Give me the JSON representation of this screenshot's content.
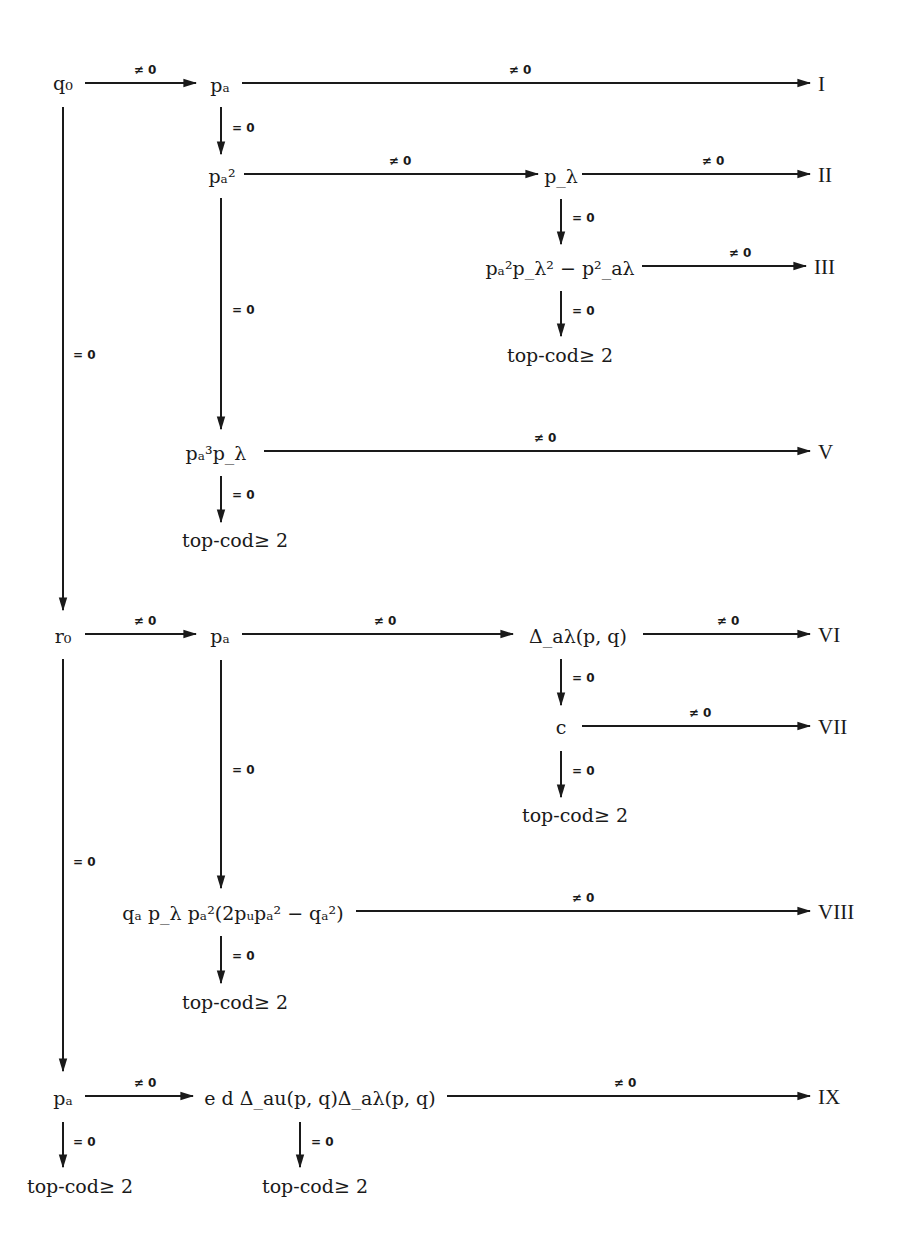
{
  "labels": {
    "nonzero": "≠ 0",
    "zero": "= 0",
    "top_cod": "top-cod≥ 2"
  },
  "nodes": {
    "q0": "q₀",
    "pa_1": "pₐ",
    "pa2": "pₐ²",
    "plambda": "p_λ",
    "pa2plambda2_minus": "pₐ²p_λ² − p²_aλ",
    "top_cod_1": "top-cod≥ 2",
    "pa3plambda": "pₐ³p_λ",
    "top_cod_2": "top-cod≥ 2",
    "r0": "r₀",
    "pa_2": "pₐ",
    "delta_alambda": "Δ_aλ(p, q)",
    "c": "c",
    "top_cod_3": "top-cod≥ 2",
    "qa_product": "qₐ p_λ pₐ²(2pᵤpₐ² − qₐ²)",
    "top_cod_4": "top-cod≥ 2",
    "pa_3": "pₐ",
    "ed_delta": "e d Δ_au(p, q)Δ_aλ(p, q)",
    "top_cod_5": "top-cod≥ 2",
    "top_cod_6": "top-cod≥ 2"
  },
  "outcomes": {
    "I": "I",
    "II": "II",
    "III": "III",
    "V": "V",
    "VI": "VI",
    "VII": "VII",
    "VIII": "VIII",
    "IX": "IX"
  },
  "edges": [
    {
      "from": "q0",
      "to": "pa_1",
      "label": "≠ 0"
    },
    {
      "from": "pa_1",
      "to": "I",
      "label": "≠ 0"
    },
    {
      "from": "pa_1",
      "to": "pa2",
      "label": "= 0"
    },
    {
      "from": "pa2",
      "to": "plambda",
      "label": "≠ 0"
    },
    {
      "from": "plambda",
      "to": "II",
      "label": "≠ 0"
    },
    {
      "from": "plambda",
      "to": "pa2plambda2_minus",
      "label": "= 0"
    },
    {
      "from": "pa2plambda2_minus",
      "to": "III",
      "label": "≠ 0"
    },
    {
      "from": "pa2plambda2_minus",
      "to": "top_cod_1",
      "label": "= 0"
    },
    {
      "from": "pa2",
      "to": "pa3plambda",
      "label": "= 0"
    },
    {
      "from": "pa3plambda",
      "to": "V",
      "label": "≠ 0"
    },
    {
      "from": "pa3plambda",
      "to": "top_cod_2",
      "label": "= 0"
    },
    {
      "from": "q0",
      "to": "r0",
      "label": "= 0"
    },
    {
      "from": "r0",
      "to": "pa_2",
      "label": "≠ 0"
    },
    {
      "from": "pa_2",
      "to": "delta_alambda",
      "label": "≠ 0"
    },
    {
      "from": "delta_alambda",
      "to": "VI",
      "label": "≠ 0"
    },
    {
      "from": "delta_alambda",
      "to": "c",
      "label": "= 0"
    },
    {
      "from": "c",
      "to": "VII",
      "label": "≠ 0"
    },
    {
      "from": "c",
      "to": "top_cod_3",
      "label": "= 0"
    },
    {
      "from": "pa_2",
      "to": "qa_product",
      "label": "= 0"
    },
    {
      "from": "qa_product",
      "to": "VIII",
      "label": "≠ 0"
    },
    {
      "from": "qa_product",
      "to": "top_cod_4",
      "label": "= 0"
    },
    {
      "from": "r0",
      "to": "pa_3",
      "label": "= 0"
    },
    {
      "from": "pa_3",
      "to": "ed_delta",
      "label": "≠ 0"
    },
    {
      "from": "ed_delta",
      "to": "IX",
      "label": "≠ 0"
    },
    {
      "from": "ed_delta",
      "to": "top_cod_5",
      "label": "= 0"
    },
    {
      "from": "pa_3",
      "to": "top_cod_6",
      "label": "= 0"
    }
  ]
}
